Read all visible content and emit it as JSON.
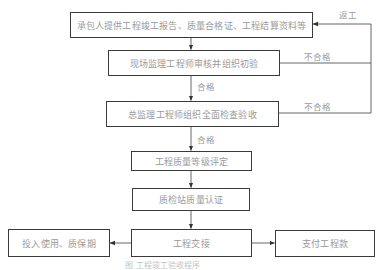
{
  "diagram": {
    "type": "flowchart",
    "nodes": [
      {
        "id": "n1",
        "label": "承包人提供工程竣工报告、质量合格证、工程结算资料等"
      },
      {
        "id": "n2",
        "label": "现场监理工程师审核并组织初验"
      },
      {
        "id": "n3",
        "label": "总监理工程师组织全面检查验收"
      },
      {
        "id": "n4",
        "label": "工程质量等级评定"
      },
      {
        "id": "n5",
        "label": "质检站质量认证"
      },
      {
        "id": "n6",
        "label": "工程交接"
      },
      {
        "id": "n7",
        "label": "投入使用、质保期"
      },
      {
        "id": "n8",
        "label": "支付工程款"
      }
    ],
    "edge_labels": {
      "rework": "返工",
      "fail_1": "不合格",
      "fail_2": "不合格",
      "pass_1": "合格",
      "pass_2": "合格"
    },
    "edges": [
      {
        "from": "n1",
        "to": "n2"
      },
      {
        "from": "n2",
        "to": "n3",
        "label": "合格"
      },
      {
        "from": "n2",
        "to": "n1",
        "label": "不合格"
      },
      {
        "from": "n3",
        "to": "n4",
        "label": "合格"
      },
      {
        "from": "n3",
        "to": "n1",
        "label": "不合格"
      },
      {
        "from": "n4",
        "to": "n5"
      },
      {
        "from": "n5",
        "to": "n6"
      },
      {
        "from": "n6",
        "to": "n7"
      },
      {
        "from": "n6",
        "to": "n8"
      }
    ],
    "caption": "图   工程竣工验收程序"
  }
}
